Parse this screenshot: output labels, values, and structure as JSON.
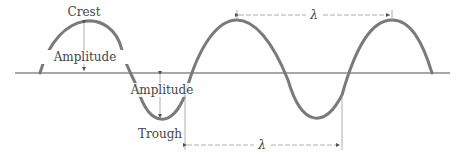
{
  "diagram": {
    "type": "transverse-wave",
    "labels": {
      "crest": "Crest",
      "trough": "Trough",
      "amplitude_top": "Amplitude",
      "amplitude_bottom": "Amplitude",
      "wavelength_top": "λ",
      "wavelength_bottom": "λ"
    },
    "colors": {
      "wave": "#7a7a7a",
      "axis": "#8a8a8a",
      "annotation": "#999999",
      "text": "#444444"
    }
  }
}
